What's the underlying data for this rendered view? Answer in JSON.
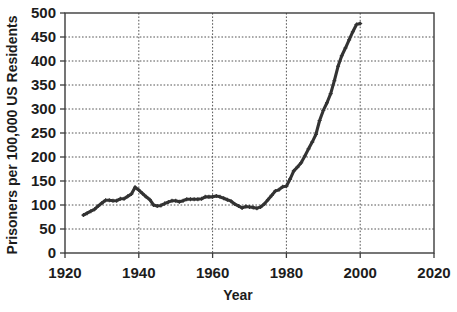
{
  "chart_data": {
    "type": "line",
    "title": "",
    "subtitle": "",
    "xlabel": "Year",
    "ylabel": "Prisoners per 100,000 US Residents",
    "xlim": [
      1920,
      2020
    ],
    "ylim": [
      0,
      500
    ],
    "xticks": [
      1920,
      1940,
      1960,
      1980,
      2000,
      2020
    ],
    "yticks": [
      0,
      50,
      100,
      150,
      200,
      250,
      300,
      350,
      400,
      450,
      500
    ],
    "xtick_labels": [
      "1920",
      "1940",
      "1960",
      "1980",
      "2000",
      "2020"
    ],
    "ytick_labels": [
      "0",
      "50",
      "100",
      "150",
      "200",
      "250",
      "300",
      "350",
      "400",
      "450",
      "500"
    ],
    "grid": true,
    "grid_style": "dotted",
    "grid_color": "#555555",
    "legend": null,
    "legend_position": "none",
    "series": [
      {
        "name": "Incarceration rate",
        "color": "#333333",
        "marker": "cross",
        "x": [
          1925,
          1926,
          1927,
          1928,
          1929,
          1930,
          1931,
          1932,
          1933,
          1934,
          1935,
          1936,
          1937,
          1938,
          1939,
          1940,
          1941,
          1942,
          1943,
          1944,
          1945,
          1946,
          1947,
          1948,
          1949,
          1950,
          1951,
          1952,
          1953,
          1954,
          1955,
          1956,
          1957,
          1958,
          1959,
          1960,
          1961,
          1962,
          1963,
          1964,
          1965,
          1966,
          1967,
          1968,
          1969,
          1970,
          1971,
          1972,
          1973,
          1974,
          1975,
          1976,
          1977,
          1978,
          1979,
          1980,
          1981,
          1982,
          1983,
          1984,
          1985,
          1986,
          1987,
          1988,
          1989,
          1990,
          1991,
          1992,
          1993,
          1994,
          1995,
          1996,
          1997,
          1998,
          1999,
          2000
        ],
        "y": [
          79,
          83,
          87,
          91,
          98,
          104,
          110,
          110,
          109,
          109,
          113,
          113,
          118,
          123,
          137,
          131,
          124,
          117,
          111,
          100,
          98,
          99,
          103,
          106,
          109,
          109,
          107,
          109,
          112,
          112,
          112,
          112,
          113,
          117,
          117,
          117,
          119,
          117,
          114,
          111,
          108,
          102,
          98,
          94,
          97,
          96,
          95,
          93,
          96,
          102,
          111,
          120,
          129,
          132,
          138,
          139,
          154,
          171,
          179,
          188,
          202,
          217,
          231,
          247,
          276,
          297,
          313,
          332,
          359,
          389,
          411,
          427,
          444,
          461,
          476,
          478
        ]
      }
    ],
    "annotations": [],
    "data_units": "prisoners per 100,000 US residents"
  },
  "axes": {
    "y_axis_title": "Prisoners per 100,000 US Residents",
    "x_axis_title": "Year"
  }
}
